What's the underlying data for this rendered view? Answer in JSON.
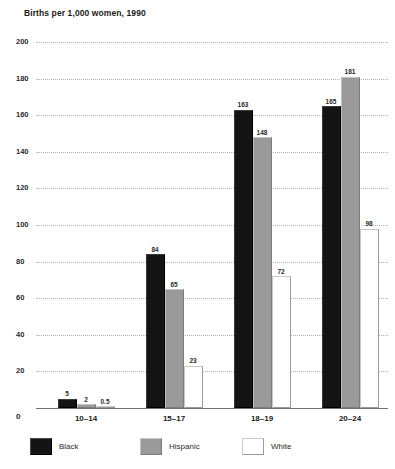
{
  "chart_data": {
    "type": "bar",
    "title": "Births per 1,000 women, 1990",
    "xlabel": "",
    "ylabel": "",
    "ylim": [
      0,
      200
    ],
    "yticks": [
      0,
      20,
      40,
      60,
      80,
      100,
      120,
      140,
      160,
      180,
      200
    ],
    "grid": true,
    "legend_position": "bottom",
    "categories": [
      "10–14",
      "15–17",
      "18–19",
      "20–24"
    ],
    "series": [
      {
        "name": "Black",
        "color": "#141414",
        "values": [
          5,
          84,
          163,
          165
        ],
        "value_labels": [
          "5",
          "84",
          "163",
          "165"
        ]
      },
      {
        "name": "Hispanic",
        "color": "#9a9a9a",
        "values": [
          2,
          65,
          148,
          181
        ],
        "value_labels": [
          "2",
          "65",
          "148",
          "181"
        ]
      },
      {
        "name": "White",
        "color": "#ffffff",
        "values": [
          0.5,
          23,
          72,
          98
        ],
        "value_labels": [
          "0.5",
          "23",
          "72",
          "98"
        ]
      }
    ]
  }
}
